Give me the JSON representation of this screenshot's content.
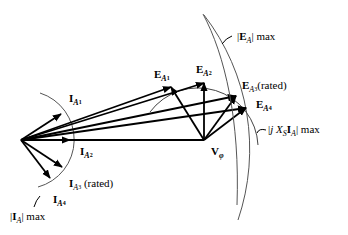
{
  "diagram": {
    "type": "phasor-diagram",
    "origin": [
      21,
      140
    ],
    "v_phi": {
      "symbol": "V",
      "sub": "φ",
      "tip": [
        204,
        140
      ]
    },
    "currents": [
      {
        "symbol": "I",
        "sub": "A",
        "subsub": "1",
        "tip": [
          61,
          114
        ],
        "note": ""
      },
      {
        "symbol": "I",
        "sub": "A",
        "subsub": "2",
        "tip": [
          68,
          140
        ],
        "note": ""
      },
      {
        "symbol": "I",
        "sub": "A",
        "subsub": "3",
        "tip": [
          62,
          167
        ],
        "note": "(rated)"
      },
      {
        "symbol": "I",
        "sub": "A",
        "subsub": "4",
        "tip": [
          50,
          177
        ],
        "note": ""
      }
    ],
    "emfs": [
      {
        "symbol": "E",
        "sub": "A",
        "subsub": "1",
        "tip": [
          171,
          87
        ],
        "note": ""
      },
      {
        "symbol": "E",
        "sub": "A",
        "subsub": "2",
        "tip": [
          204,
          83
        ],
        "note": ""
      },
      {
        "symbol": "E",
        "sub": "A",
        "subsub": "3",
        "tip": [
          236,
          96
        ],
        "note": "(rated)"
      },
      {
        "symbol": "E",
        "sub": "A",
        "subsub": "4",
        "tip": [
          246,
          108
        ],
        "note": ""
      }
    ],
    "limits": {
      "ia_max": {
        "pre": "|",
        "symbol": "I",
        "sub": "A",
        "post": "| max"
      },
      "ea_max": {
        "pre": "|",
        "symbol": "E",
        "sub": "A",
        "post": "| max"
      },
      "jxs_max": {
        "pre": "|",
        "j": "j",
        "x": "X",
        "xsub": "S",
        "symbol": "I",
        "sub": "A",
        "post": "| max"
      }
    }
  }
}
